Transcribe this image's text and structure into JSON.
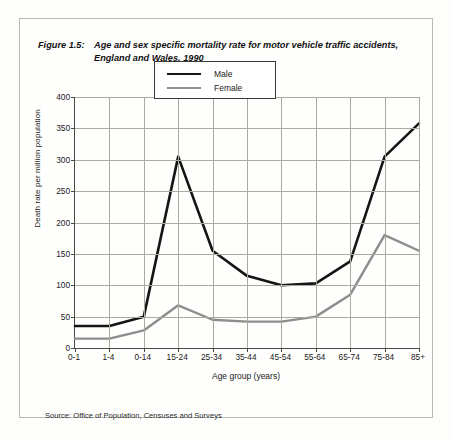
{
  "figure": {
    "number": "Figure 1.5:",
    "title_line1": "Age and sex specific mortality rate for motor vehicle traffic accidents,",
    "title_line2": "England and Wales, 1990"
  },
  "source": "Source: Office of Population, Censuses and Surveys",
  "legend": {
    "male_label": "Male",
    "female_label": "Female"
  },
  "colors": {
    "male": "#151515",
    "female": "#8d8d8d",
    "grid": "#a9a9a4",
    "axis": "#4a4a4a",
    "frame": "#b9b9b4"
  },
  "chart_data": {
    "type": "line",
    "title": "Age and sex specific mortality rate for motor vehicle traffic accidents, England and Wales, 1990",
    "xlabel": "Age group (years)",
    "ylabel": "Death rate per million population",
    "categories": [
      "0-1",
      "1-4",
      "0-14",
      "15-24",
      "25-34",
      "35-44",
      "45-54",
      "55-64",
      "65-74",
      "75-84",
      "85+"
    ],
    "ytick_labels": [
      "0",
      "50",
      "100",
      "150",
      "200",
      "250",
      "300",
      "350",
      "400"
    ],
    "yticks": [
      0,
      50,
      100,
      150,
      200,
      250,
      300,
      350,
      400
    ],
    "ylim": [
      0,
      400
    ],
    "grid": true,
    "legend_position": "top-center",
    "series": [
      {
        "name": "Male",
        "color": "#151515",
        "values": [
          35,
          35,
          50,
          305,
          155,
          115,
          100,
          103,
          138,
          305,
          358
        ]
      },
      {
        "name": "Female",
        "color": "#8d8d8d",
        "values": [
          15,
          15,
          28,
          68,
          45,
          42,
          42,
          50,
          85,
          180,
          155
        ]
      }
    ]
  }
}
